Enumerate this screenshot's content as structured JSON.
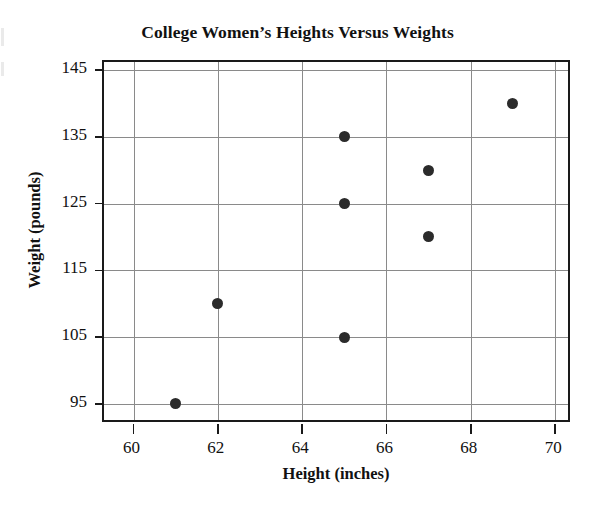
{
  "chart_data": {
    "type": "scatter",
    "title": "College Women’s Heights Versus Weights",
    "xlabel": "Height (inches)",
    "ylabel": "Weight (pounds)",
    "xlim": [
      59.3,
      70.4
    ],
    "ylim": [
      92.0,
      146.2
    ],
    "xticks": [
      60,
      62,
      64,
      66,
      68,
      70
    ],
    "yticks": [
      95,
      105,
      115,
      125,
      135,
      145
    ],
    "xtick_labels": [
      "60",
      "62",
      "64",
      "66",
      "68",
      "70"
    ],
    "ytick_labels": [
      "95",
      "105",
      "115",
      "125",
      "135",
      "145"
    ],
    "grid": true,
    "legend": "none",
    "marker": "filled-circle",
    "marker_color": "#2b2b2b",
    "grid_color": "#8a8a8a",
    "frame_color": "#1a1a1a",
    "points": [
      {
        "height": 61,
        "weight": 95
      },
      {
        "height": 62,
        "weight": 110
      },
      {
        "height": 65,
        "weight": 105
      },
      {
        "height": 65,
        "weight": 125
      },
      {
        "height": 65,
        "weight": 135
      },
      {
        "height": 67,
        "weight": 120
      },
      {
        "height": 67,
        "weight": 130
      },
      {
        "height": 69,
        "weight": 140
      }
    ],
    "x": [
      61,
      62,
      65,
      65,
      65,
      67,
      67,
      69
    ],
    "y": [
      95,
      110,
      105,
      125,
      135,
      120,
      130,
      140
    ]
  }
}
